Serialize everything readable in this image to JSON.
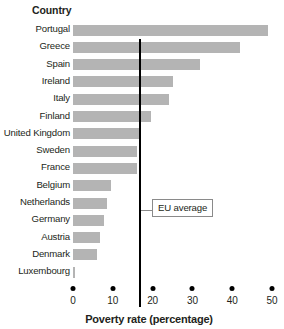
{
  "header": {
    "country_label": "Country"
  },
  "annotation": {
    "eu_average_label": "EU average"
  },
  "axis": {
    "x_title": "Poverty rate (percentage)",
    "ticks": [
      "0",
      "10",
      "20",
      "30",
      "40",
      "50"
    ]
  },
  "colors": {
    "bar_fill": "#b4b4b4",
    "reference_line": "#000000",
    "text": "#231f20",
    "callout_border": "#8a8a8a"
  },
  "chart_data": {
    "type": "bar",
    "orientation": "horizontal",
    "title": "",
    "subtitle": "",
    "xlabel": "Poverty rate (percentage)",
    "ylabel": "Country",
    "xlim": [
      0,
      52
    ],
    "xticks": [
      0,
      10,
      20,
      30,
      40,
      50
    ],
    "grid": false,
    "legend": null,
    "categories": [
      "Portugal",
      "Greece",
      "Spain",
      "Ireland",
      "Italy",
      "Finland",
      "United Kingdom",
      "Sweden",
      "France",
      "Belgium",
      "Netherlands",
      "Germany",
      "Austria",
      "Denmark",
      "Luxembourg"
    ],
    "values": [
      49,
      42,
      32,
      25,
      24,
      19.5,
      16.5,
      16,
      16,
      9.5,
      8.5,
      7.8,
      6.8,
      6,
      0.6
    ],
    "annotations": [
      {
        "type": "vline",
        "label": "EU average",
        "value": 16.8
      }
    ]
  }
}
